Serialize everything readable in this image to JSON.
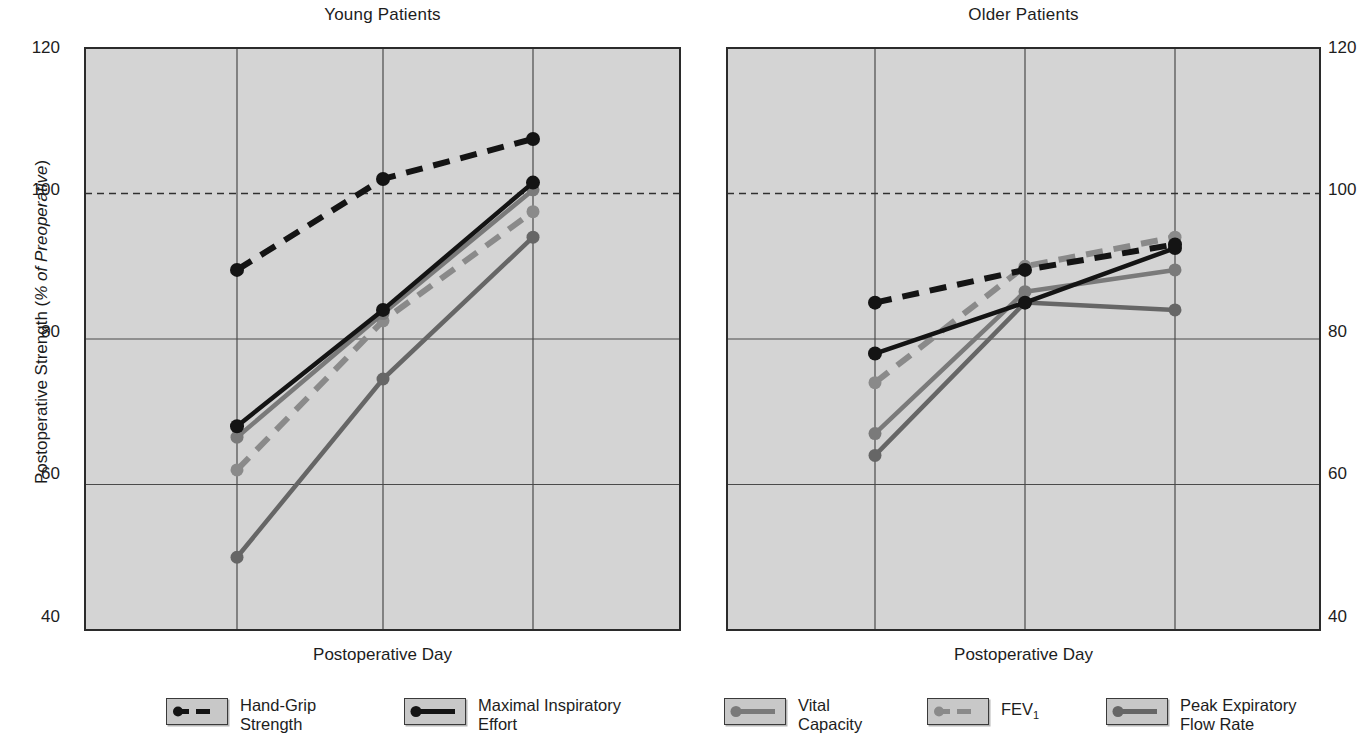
{
  "chart_data": {
    "type": "line",
    "panels": [
      {
        "title": "Young Patients",
        "xlabel": "Postoperative Day",
        "ylabel": "Postoperative Strength (% of Preoperative)",
        "x": [
          2,
          4,
          6
        ],
        "xticks": [
          "2",
          "4",
          "6"
        ],
        "yticks": [
          "120",
          "100",
          "80",
          "60",
          "40"
        ],
        "xlim": [
          1,
          7
        ],
        "ylim": [
          40,
          120
        ],
        "grid": true,
        "reference_line": 100,
        "series": [
          {
            "name": "Hand-Grip Strength",
            "values": [
              89.5,
              102,
              107.5
            ],
            "color": "#141414",
            "style": "dashed"
          },
          {
            "name": "Maximal Inspiratory Effort",
            "values": [
              68,
              84,
              101.5
            ],
            "color": "#141414",
            "style": "solid"
          },
          {
            "name": "Vital Capacity",
            "values": [
              66.5,
              83.5,
              100.5
            ],
            "color": "#7a7a7a",
            "style": "solid"
          },
          {
            "name": "FEV1",
            "values": [
              62,
              82.5,
              97.5
            ],
            "color": "#8a8a8a",
            "style": "dashed"
          },
          {
            "name": "Peak Expiratory Flow Rate",
            "values": [
              50,
              74.5,
              94
            ],
            "color": "#666666",
            "style": "solid"
          }
        ]
      },
      {
        "title": "Older Patients",
        "xlabel": "Postoperative Day",
        "ylabel": "",
        "x": [
          2,
          4,
          6
        ],
        "xticks": [
          "2",
          "4",
          "6"
        ],
        "yticks": [
          "120",
          "100",
          "80",
          "60",
          "40"
        ],
        "xlim": [
          1,
          7
        ],
        "ylim": [
          40,
          120
        ],
        "grid": true,
        "reference_line": 100,
        "series": [
          {
            "name": "Hand-Grip Strength",
            "values": [
              85,
              89.5,
              93
            ],
            "color": "#141414",
            "style": "dashed"
          },
          {
            "name": "Maximal Inspiratory Effort",
            "values": [
              78,
              85,
              92.5
            ],
            "color": "#141414",
            "style": "solid"
          },
          {
            "name": "Vital Capacity",
            "values": [
              67,
              86.5,
              89.5
            ],
            "color": "#7a7a7a",
            "style": "solid"
          },
          {
            "name": "FEV1",
            "values": [
              74,
              90,
              94
            ],
            "color": "#8a8a8a",
            "style": "dashed"
          },
          {
            "name": "Peak Expiratory Flow Rate",
            "values": [
              64,
              85,
              84
            ],
            "color": "#666666",
            "style": "solid"
          }
        ]
      }
    ],
    "legend": {
      "position": "bottom",
      "entries": [
        {
          "label_line1": "Hand-Grip",
          "label_line2": "Strength",
          "color": "#141414",
          "style": "dashed"
        },
        {
          "label_line1": "Maximal Inspiratory",
          "label_line2": "Effort",
          "color": "#141414",
          "style": "solid"
        },
        {
          "label_line1": "Vital",
          "label_line2": "Capacity",
          "color": "#7a7a7a",
          "style": "solid"
        },
        {
          "label_line1": "FEV",
          "label_sub": "1",
          "label_line2": "",
          "color": "#8a8a8a",
          "style": "dashed"
        },
        {
          "label_line1": "Peak Expiratory",
          "label_line2": "Flow Rate",
          "color": "#666666",
          "style": "solid"
        }
      ]
    },
    "colors": {
      "plot_background": "#d4d4d4",
      "grid": "#4a4a4a",
      "axis": "#2b2b2b",
      "text": "#1d1d1d"
    }
  },
  "panel_young": {
    "title": "Young Patients",
    "xlabel": "Postoperative Day",
    "ylabel_plain": "Postoperative Strength (",
    "ylabel_italic": "% of Preoperative",
    "ylabel_tail": ")",
    "yticks": [
      "120",
      "100",
      "80",
      "60",
      "40"
    ],
    "xticks": [
      "2",
      "4",
      "6"
    ]
  },
  "panel_older": {
    "title": "Older Patients",
    "xlabel": "Postoperative Day",
    "yticks": [
      "120",
      "100",
      "80",
      "60",
      "40"
    ],
    "xticks": [
      "2",
      "4",
      "6"
    ]
  },
  "legend": {
    "items": [
      {
        "line1": "Hand-Grip",
        "line2": "Strength"
      },
      {
        "line1": "Maximal Inspiratory",
        "line2": "Effort"
      },
      {
        "line1": "Vital",
        "line2": "Capacity"
      },
      {
        "line1": "FEV",
        "sub": "1",
        "line2": ""
      },
      {
        "line1": "Peak Expiratory",
        "line2": "Flow Rate"
      }
    ]
  }
}
